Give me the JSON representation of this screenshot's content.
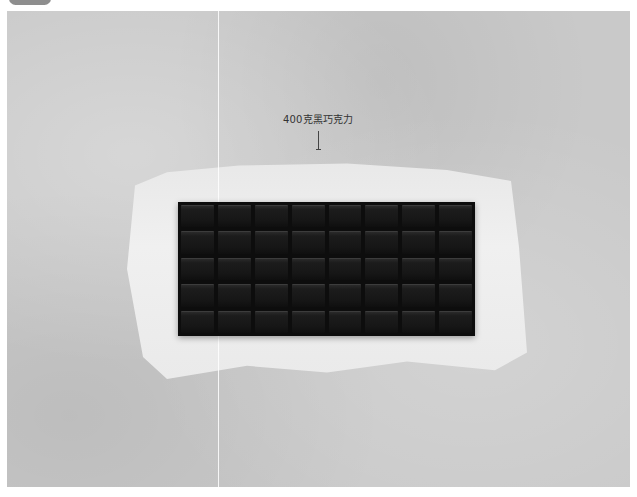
{
  "image": {
    "subject": "dark chocolate bar on white parchment paper over grey concrete surface",
    "chocolate_grid": {
      "columns": 8,
      "rows": 5
    }
  },
  "annotation": {
    "label": "400克黑巧克力",
    "arrow_direction": "down"
  },
  "colors": {
    "background": "#c9c9c9",
    "paper": "#ececec",
    "chocolate": "#111111",
    "label_text": "#333333",
    "badge": "#8e8e8e"
  }
}
